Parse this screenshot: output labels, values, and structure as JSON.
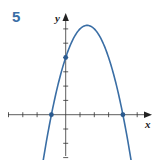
{
  "problem": {
    "number": "5"
  },
  "chart_data": {
    "type": "line",
    "title": "",
    "xlabel": "x",
    "ylabel": "y",
    "function": "y = -(x+1)(x-4) = -x^2 + 3x + 4",
    "xlim": [
      -4,
      5.5
    ],
    "ylim": [
      -3,
      6.5
    ],
    "grid": false,
    "x_ticks": [
      -4,
      -3,
      -2,
      -1,
      1,
      2,
      3,
      4,
      5
    ],
    "y_ticks": [
      -3,
      -2,
      -1,
      1,
      2,
      3,
      4,
      5,
      6
    ],
    "marked_points": [
      {
        "x": -1,
        "y": 0,
        "label": "x-intercept"
      },
      {
        "x": 4,
        "y": 0,
        "label": "x-intercept"
      },
      {
        "x": 0,
        "y": 4,
        "label": "y-intercept"
      }
    ],
    "vertex": {
      "x": 1.5,
      "y": 6.25
    },
    "series": [
      {
        "name": "parabola",
        "color": "#3a6ea5",
        "x": [
          -1.75,
          -1,
          0,
          1,
          1.5,
          2,
          3,
          4,
          4.75
        ],
        "y": [
          -2.31,
          0,
          4,
          6,
          6.25,
          6,
          4,
          0,
          -2.31
        ]
      }
    ]
  },
  "colors": {
    "curve": "#3a6ea5",
    "axis": "#333333",
    "number": "#3a6ea5"
  }
}
